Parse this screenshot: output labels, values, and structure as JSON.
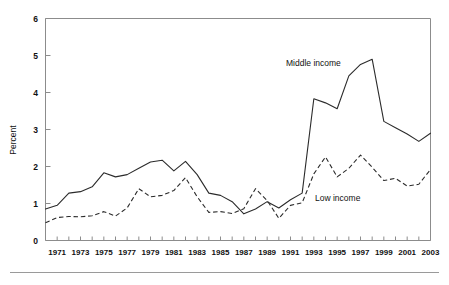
{
  "chart_data": {
    "type": "line",
    "title": "",
    "subtitle": "",
    "xlabel": "",
    "ylabel": "Percent",
    "ylim": [
      0,
      6
    ],
    "xlim": [
      1970,
      2003
    ],
    "yticks": [
      "0",
      "1",
      "2",
      "3",
      "4",
      "5",
      "6"
    ],
    "grid": false,
    "legend_position": "inline-annotations",
    "x": [
      1970,
      1971,
      1972,
      1973,
      1974,
      1975,
      1976,
      1977,
      1978,
      1979,
      1980,
      1981,
      1982,
      1983,
      1984,
      1985,
      1986,
      1987,
      1988,
      1989,
      1990,
      1991,
      1992,
      1993,
      1994,
      1995,
      1996,
      1997,
      1998,
      1999,
      2000,
      2001,
      2002,
      2003
    ],
    "xtick_labels": [
      "1971",
      "1973",
      "1975",
      "1977",
      "1979",
      "1981",
      "1983",
      "1985",
      "1987",
      "1989",
      "1991",
      "1993",
      "1995",
      "1997",
      "1999",
      "2001",
      "2003"
    ],
    "series": [
      {
        "name": "Middle income",
        "style": "solid",
        "color": "#2b2b2b",
        "annotation": "Middle income",
        "values": [
          0.85,
          0.95,
          1.28,
          1.32,
          1.45,
          1.83,
          1.72,
          1.78,
          1.95,
          2.12,
          2.17,
          1.88,
          2.14,
          1.78,
          1.28,
          1.22,
          1.05,
          0.72,
          0.85,
          1.05,
          0.88,
          1.1,
          1.28,
          3.83,
          3.72,
          3.56,
          4.45,
          4.76,
          4.9,
          3.22,
          3.05,
          2.88,
          2.68,
          2.9
        ]
      },
      {
        "name": "Low income",
        "style": "dashed",
        "color": "#2b2b2b",
        "annotation": "Low income",
        "values": [
          0.48,
          0.62,
          0.65,
          0.64,
          0.67,
          0.78,
          0.66,
          0.88,
          1.4,
          1.18,
          1.22,
          1.35,
          1.7,
          1.18,
          0.76,
          0.78,
          0.73,
          0.86,
          1.4,
          1.08,
          0.6,
          0.95,
          1.02,
          1.8,
          2.26,
          1.72,
          1.95,
          2.31,
          1.98,
          1.62,
          1.68,
          1.47,
          1.52,
          1.92
        ]
      }
    ]
  },
  "annotations": {
    "middle_income_label": "Middle income",
    "low_income_label": "Low income"
  },
  "axis": {
    "y_title": "Percent"
  }
}
